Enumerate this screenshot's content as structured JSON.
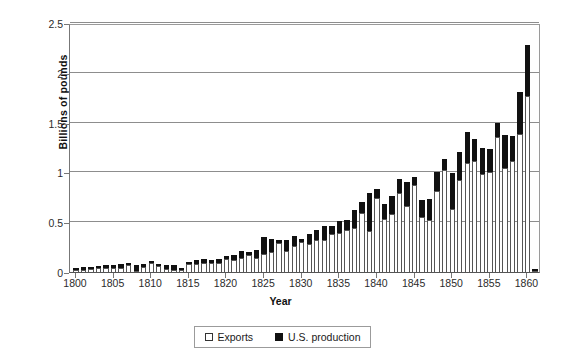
{
  "chart_data": {
    "type": "bar",
    "title": "",
    "subtitle": "",
    "xlabel": "Year",
    "ylabel": "Billions of pounds",
    "xlim": [
      1799.2,
      1861.8
    ],
    "ylim": [
      0,
      2.5
    ],
    "yticks": [
      "0",
      "0.5",
      "1",
      "1.5",
      "2",
      "2.5"
    ],
    "ytick_values": [
      0,
      0.5,
      1,
      1.5,
      2,
      2.5
    ],
    "xticks": [
      "1800",
      "1805",
      "1810",
      "1815",
      "1820",
      "1825",
      "1830",
      "1835",
      "1840",
      "1845",
      "1850",
      "1855",
      "1860"
    ],
    "xtick_values": [
      1800,
      1805,
      1810,
      1815,
      1820,
      1825,
      1830,
      1835,
      1840,
      1845,
      1850,
      1855,
      1860
    ],
    "grid": "horizontal",
    "stacked": true,
    "legend_position": "bottom",
    "legend": [
      "Exports",
      "U.S. production"
    ],
    "categories": [
      1800,
      1801,
      1802,
      1803,
      1804,
      1805,
      1806,
      1807,
      1808,
      1809,
      1810,
      1811,
      1812,
      1813,
      1814,
      1815,
      1816,
      1817,
      1818,
      1819,
      1820,
      1821,
      1822,
      1823,
      1824,
      1825,
      1826,
      1827,
      1828,
      1829,
      1830,
      1831,
      1832,
      1833,
      1834,
      1835,
      1836,
      1837,
      1838,
      1839,
      1840,
      1841,
      1842,
      1843,
      1844,
      1845,
      1846,
      1847,
      1848,
      1849,
      1850,
      1851,
      1852,
      1853,
      1854,
      1855,
      1856,
      1857,
      1858,
      1859,
      1860,
      1861
    ],
    "series": [
      {
        "name": "Exports",
        "color": "#ffffff",
        "values": [
          0.018,
          0.02,
          0.028,
          0.041,
          0.038,
          0.04,
          0.038,
          0.066,
          0.012,
          0.053,
          0.093,
          0.062,
          0.029,
          0.019,
          0.018,
          0.083,
          0.081,
          0.086,
          0.092,
          0.088,
          0.128,
          0.125,
          0.144,
          0.174,
          0.143,
          0.176,
          0.204,
          0.295,
          0.211,
          0.265,
          0.298,
          0.277,
          0.322,
          0.325,
          0.385,
          0.387,
          0.424,
          0.444,
          0.596,
          0.414,
          0.744,
          0.53,
          0.585,
          0.793,
          0.664,
          0.873,
          0.548,
          0.527,
          0.814,
          1.026,
          0.635,
          0.927,
          1.093,
          1.111,
          0.988,
          1.008,
          1.352,
          1.048,
          1.118,
          1.386,
          1.768,
          0.01
        ]
      },
      {
        "name": "U.S. production",
        "color": "#111111",
        "values": [
          0.017,
          0.028,
          0.027,
          0.019,
          0.032,
          0.03,
          0.042,
          0.014,
          0.063,
          0.029,
          0.007,
          0.018,
          0.046,
          0.056,
          0.007,
          0.01,
          0.043,
          0.045,
          0.033,
          0.04,
          0.032,
          0.041,
          0.066,
          0.031,
          0.077,
          0.179,
          0.126,
          0.031,
          0.113,
          0.1,
          0.032,
          0.103,
          0.096,
          0.135,
          0.075,
          0.128,
          0.099,
          0.18,
          0.106,
          0.376,
          0.09,
          0.15,
          0.175,
          0.142,
          0.236,
          0.078,
          0.179,
          0.203,
          0.186,
          0.104,
          0.361,
          0.273,
          0.31,
          0.229,
          0.262,
          0.232,
          0.148,
          0.332,
          0.252,
          0.424,
          0.51,
          0.02
        ]
      }
    ],
    "totals": [
      0.035,
      0.048,
      0.055,
      0.06,
      0.07,
      0.07,
      0.08,
      0.08,
      0.075,
      0.082,
      0.1,
      0.08,
      0.075,
      0.075,
      0.025,
      0.093,
      0.124,
      0.131,
      0.125,
      0.128,
      0.16,
      0.166,
      0.21,
      0.205,
      0.22,
      0.355,
      0.33,
      0.326,
      0.324,
      0.365,
      0.33,
      0.38,
      0.418,
      0.46,
      0.46,
      0.515,
      0.523,
      0.624,
      0.702,
      0.79,
      0.834,
      0.68,
      0.76,
      0.935,
      0.9,
      0.951,
      0.727,
      0.73,
      1.0,
      1.13,
      0.996,
      1.2,
      1.403,
      1.34,
      1.25,
      1.24,
      1.5,
      1.38,
      1.37,
      1.81,
      2.278,
      0.03
    ]
  },
  "legend": {
    "items": [
      {
        "label": "Exports",
        "swatch": "open-square"
      },
      {
        "label": "U.S. production",
        "swatch": "filled-square"
      }
    ]
  },
  "axes": {
    "y_title": "Billions of pounds",
    "x_title": "Year"
  },
  "colors": {
    "exports_fill": "#ffffff",
    "exports_stroke": "#555555",
    "production_fill": "#111111",
    "gridline": "#8d8d8d",
    "axis": "#777777",
    "background": "#ffffff"
  }
}
